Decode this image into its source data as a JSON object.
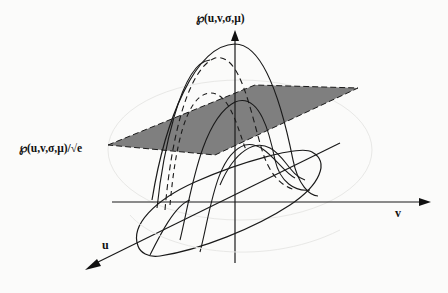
{
  "figure": {
    "type": "3d-gaussian-surface-diagram",
    "labels": {
      "top_axis": "℘(u,v,σ,μ)",
      "plane_level": "℘(u,v,σ,μ)/√e",
      "v_axis": "v",
      "u_axis": "u"
    },
    "colors": {
      "background": "#fbfbfa",
      "line": "#1a1a1a",
      "plane_fill": "#808080",
      "faint_circle": "#e6e6e4"
    },
    "axes": [
      "℘ (vertical)",
      "v (horizontal)",
      "u (diagonal, toward viewer)"
    ],
    "elements": [
      "gaussian-peak-curves",
      "dashed-cross-section-curves",
      "gray-cutting-plane",
      "elliptical-base-contour"
    ]
  }
}
